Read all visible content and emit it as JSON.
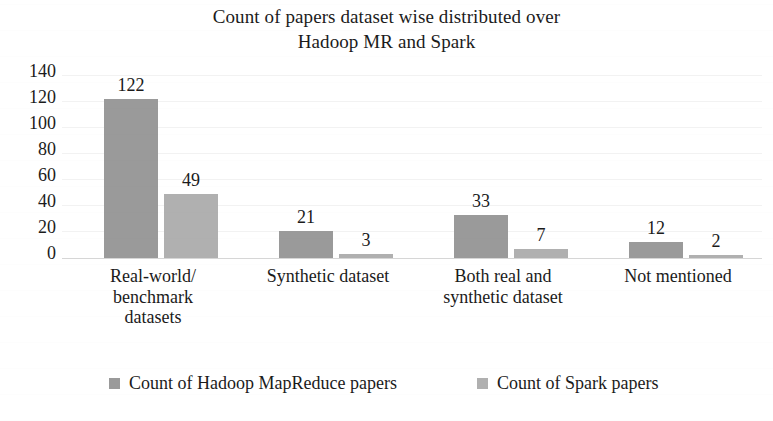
{
  "chart_data": {
    "type": "bar",
    "title": "Count of papers dataset wise distributed over Hadoop MR and Spark",
    "title_lines": [
      "Count of papers dataset wise distributed over",
      "Hadoop MR and Spark"
    ],
    "xlabel": "",
    "ylabel": "",
    "ylim": [
      0,
      140
    ],
    "ytick_labels": [
      "140",
      "120",
      "100",
      "80",
      "60",
      "40",
      "20",
      "0"
    ],
    "ytick_values": [
      140,
      120,
      100,
      80,
      60,
      40,
      20,
      0
    ],
    "grid": true,
    "legend_position": "bottom",
    "categories": [
      "Real-world/ benchmark datasets",
      "Synthetic dataset",
      "Both real and synthetic dataset",
      "Not mentioned"
    ],
    "category_lines": [
      [
        "Real-world/",
        "benchmark",
        "datasets"
      ],
      [
        "Synthetic dataset"
      ],
      [
        "Both real and",
        "synthetic dataset"
      ],
      [
        "Not mentioned"
      ]
    ],
    "series": [
      {
        "name": "Count of Hadoop MapReduce papers",
        "color": "#9a9a9a",
        "values": [
          122,
          21,
          33,
          12
        ],
        "value_labels": [
          "122",
          "21",
          "33",
          "12"
        ]
      },
      {
        "name": "Count of Spark papers",
        "color": "#b0b0b0",
        "values": [
          49,
          3,
          7,
          2
        ],
        "value_labels": [
          "49",
          "3",
          "7",
          "2"
        ]
      }
    ]
  },
  "legend": {
    "items": [
      {
        "label": "Count of Hadoop MapReduce papers",
        "color": "#9a9a9a"
      },
      {
        "label": "Count of Spark papers",
        "color": "#b0b0b0"
      }
    ]
  },
  "colors": {
    "background": "#ffffff",
    "text": "#1b1b1b",
    "gridline": "#f2f2f2",
    "axis": "#d6d6d6",
    "series_hadoop": "#9a9a9a",
    "series_spark": "#b0b0b0"
  }
}
